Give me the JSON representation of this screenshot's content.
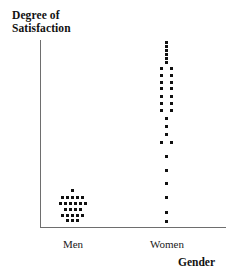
{
  "chart_data": {
    "type": "scatter",
    "title": "Degree of Satisfaction",
    "ylabel": "Degree of Satisfaction",
    "xlabel": "Gender",
    "grid": false,
    "legend": null,
    "categories": [
      "Men",
      "Women"
    ],
    "axis": {
      "y_axis_visible": true,
      "x_axis_visible": true,
      "y_tick_labels": [],
      "x_tick_labels": [
        "Men",
        "Women"
      ]
    },
    "series": [
      {
        "name": "Men",
        "category": "Men",
        "count": 24,
        "points": [
          {
            "x": 72,
            "y": 190
          },
          {
            "x": 62,
            "y": 197
          },
          {
            "x": 67,
            "y": 197
          },
          {
            "x": 72,
            "y": 197
          },
          {
            "x": 77,
            "y": 197
          },
          {
            "x": 82,
            "y": 197
          },
          {
            "x": 60,
            "y": 203
          },
          {
            "x": 65,
            "y": 203
          },
          {
            "x": 70,
            "y": 203
          },
          {
            "x": 75,
            "y": 203
          },
          {
            "x": 80,
            "y": 203
          },
          {
            "x": 85,
            "y": 203
          },
          {
            "x": 65,
            "y": 209
          },
          {
            "x": 70,
            "y": 209
          },
          {
            "x": 75,
            "y": 209
          },
          {
            "x": 80,
            "y": 209
          },
          {
            "x": 62,
            "y": 215
          },
          {
            "x": 67,
            "y": 215
          },
          {
            "x": 72,
            "y": 215
          },
          {
            "x": 77,
            "y": 215
          },
          {
            "x": 82,
            "y": 215
          },
          {
            "x": 67,
            "y": 220
          },
          {
            "x": 72,
            "y": 220
          },
          {
            "x": 77,
            "y": 220
          }
        ]
      },
      {
        "name": "Women",
        "category": "Women",
        "count": 31,
        "points": [
          {
            "x": 166,
            "y": 42
          },
          {
            "x": 166,
            "y": 46
          },
          {
            "x": 166,
            "y": 50
          },
          {
            "x": 166,
            "y": 54
          },
          {
            "x": 166,
            "y": 58
          },
          {
            "x": 166,
            "y": 62
          },
          {
            "x": 161,
            "y": 68
          },
          {
            "x": 171,
            "y": 68
          },
          {
            "x": 161,
            "y": 75
          },
          {
            "x": 171,
            "y": 75
          },
          {
            "x": 161,
            "y": 82
          },
          {
            "x": 171,
            "y": 82
          },
          {
            "x": 161,
            "y": 88
          },
          {
            "x": 171,
            "y": 88
          },
          {
            "x": 161,
            "y": 96
          },
          {
            "x": 171,
            "y": 96
          },
          {
            "x": 161,
            "y": 103
          },
          {
            "x": 171,
            "y": 103
          },
          {
            "x": 161,
            "y": 110
          },
          {
            "x": 171,
            "y": 110
          },
          {
            "x": 166,
            "y": 118
          },
          {
            "x": 166,
            "y": 126
          },
          {
            "x": 166,
            "y": 134
          },
          {
            "x": 161,
            "y": 142
          },
          {
            "x": 171,
            "y": 142
          },
          {
            "x": 166,
            "y": 156
          },
          {
            "x": 166,
            "y": 170
          },
          {
            "x": 166,
            "y": 183
          },
          {
            "x": 166,
            "y": 197
          },
          {
            "x": 166,
            "y": 212
          },
          {
            "x": 166,
            "y": 221
          }
        ]
      }
    ],
    "colors": {
      "dot": "#111111",
      "axis": "#6e6e6e",
      "background": "#ffffff",
      "text": "#111111"
    }
  }
}
